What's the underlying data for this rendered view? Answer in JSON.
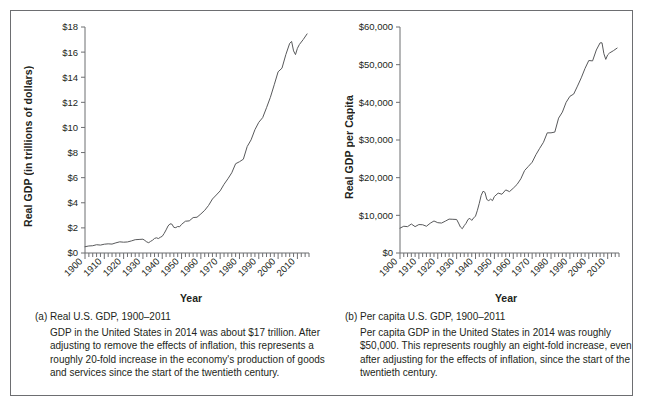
{
  "figure": {
    "border_color": "#6d6e71",
    "line_color": "#58595b",
    "background": "#ffffff"
  },
  "panels": [
    {
      "id": "panel-a",
      "caption_title": "(a) Real U.S. GDP, 1900–2011",
      "caption_body": "GDP in the United States in 2014 was about $17 trillion. After adjusting to remove the effects of inflation, this represents a roughly 20-fold increase in the economy's production of goods and services since the start of the twentieth century.",
      "chart_data": {
        "type": "line",
        "title": "",
        "xlabel": "Year",
        "ylabel": "Real GDP (in trillions of dollars)",
        "xlim": [
          1900,
          2016
        ],
        "ylim": [
          0,
          18
        ],
        "ytick_labels": [
          "$0",
          "$2",
          "$4",
          "$6",
          "$8",
          "$10",
          "$12",
          "$14",
          "$16",
          "$18"
        ],
        "ytick_values": [
          0,
          2,
          4,
          6,
          8,
          10,
          12,
          14,
          16,
          18
        ],
        "xtick_labels": [
          "1900",
          "1910",
          "1920",
          "1930",
          "1940",
          "1950",
          "1960",
          "1970",
          "1980",
          "1990",
          "2000",
          "2010"
        ],
        "xtick_values": [
          1900,
          1910,
          1920,
          1930,
          1940,
          1950,
          1960,
          1970,
          1980,
          1990,
          2000,
          2010
        ],
        "xminor_step": 2,
        "grid": false,
        "legend": "none",
        "units": "trillions of chained dollars",
        "series": [
          {
            "name": "Real U.S. GDP",
            "x": [
              1900,
              1902,
              1904,
              1906,
              1908,
              1910,
              1912,
              1914,
              1916,
              1918,
              1920,
              1922,
              1924,
              1926,
              1928,
              1930,
              1931,
              1932,
              1933,
              1934,
              1935,
              1936,
              1937,
              1938,
              1939,
              1940,
              1941,
              1942,
              1943,
              1944,
              1945,
              1946,
              1947,
              1948,
              1949,
              1950,
              1952,
              1954,
              1956,
              1958,
              1960,
              1962,
              1964,
              1966,
              1968,
              1970,
              1972,
              1974,
              1976,
              1978,
              1980,
              1982,
              1984,
              1986,
              1988,
              1990,
              1992,
              1994,
              1996,
              1998,
              2000,
              2002,
              2004,
              2006,
              2007,
              2008,
              2009,
              2010,
              2011,
              2013,
              2015
            ],
            "y": [
              0.5,
              0.56,
              0.58,
              0.66,
              0.63,
              0.7,
              0.73,
              0.71,
              0.81,
              0.89,
              0.86,
              0.88,
              0.96,
              1.06,
              1.08,
              1.1,
              1.0,
              0.88,
              0.82,
              0.93,
              1.02,
              1.16,
              1.21,
              1.15,
              1.25,
              1.33,
              1.56,
              1.84,
              2.15,
              2.32,
              2.3,
              2.04,
              2.02,
              2.11,
              2.09,
              2.28,
              2.53,
              2.56,
              2.82,
              2.85,
              3.11,
              3.4,
              3.79,
              4.3,
              4.62,
              4.95,
              5.47,
              5.91,
              6.39,
              7.11,
              7.27,
              7.47,
              8.48,
              9.01,
              9.82,
              10.41,
              10.78,
              11.57,
              12.4,
              13.4,
              14.43,
              14.72,
              15.8,
              16.7,
              16.85,
              16.1,
              15.8,
              16.3,
              16.6,
              17.0,
              17.45
            ]
          }
        ]
      }
    },
    {
      "id": "panel-b",
      "caption_title": "(b) Per capita U.S. GDP, 1900–2011",
      "caption_body": "Per capita GDP in the United States in 2014 was roughly $50,000. This represents roughly an eight-fold increase, even after adjusting for the effects of inflation, since the start of the twentieth century.",
      "chart_data": {
        "type": "line",
        "title": "",
        "xlabel": "Year",
        "ylabel": "Real GDP per Capita",
        "xlim": [
          1900,
          2016
        ],
        "ylim": [
          0,
          60000
        ],
        "ytick_labels": [
          "$0",
          "$10,000",
          "$20,000",
          "$30,000",
          "$40,000",
          "$50,000",
          "$60,000"
        ],
        "ytick_values": [
          0,
          10000,
          20000,
          30000,
          40000,
          50000,
          60000
        ],
        "xtick_labels": [
          "1900",
          "1910",
          "1920",
          "1930",
          "1940",
          "1950",
          "1960",
          "1970",
          "1980",
          "1990",
          "2000",
          "2010"
        ],
        "xtick_values": [
          1900,
          1910,
          1920,
          1930,
          1940,
          1950,
          1960,
          1970,
          1980,
          1990,
          2000,
          2010
        ],
        "xminor_step": 2,
        "grid": false,
        "legend": "none",
        "units": "chained dollars per person",
        "series": [
          {
            "name": "Real U.S. GDP per Capita",
            "x": [
              1900,
              1902,
              1904,
              1906,
              1908,
              1910,
              1912,
              1914,
              1916,
              1918,
              1920,
              1922,
              1924,
              1926,
              1928,
              1930,
              1931,
              1932,
              1933,
              1934,
              1935,
              1936,
              1937,
              1938,
              1939,
              1940,
              1941,
              1942,
              1943,
              1944,
              1945,
              1946,
              1947,
              1948,
              1949,
              1950,
              1952,
              1954,
              1956,
              1958,
              1960,
              1962,
              1964,
              1966,
              1968,
              1970,
              1972,
              1974,
              1976,
              1978,
              1980,
              1982,
              1984,
              1986,
              1988,
              1990,
              1992,
              1994,
              1996,
              1998,
              2000,
              2002,
              2004,
              2006,
              2007,
              2008,
              2009,
              2010,
              2011,
              2013,
              2015
            ],
            "y": [
              6600,
              7100,
              7000,
              7700,
              7000,
              7550,
              7500,
              7100,
              7900,
              8500,
              8050,
              7950,
              8450,
              9000,
              8950,
              8900,
              7950,
              6900,
              6450,
              7250,
              7900,
              8900,
              9200,
              8650,
              9300,
              9800,
              11350,
              13200,
              15300,
              16400,
              16100,
              14200,
              13900,
              14300,
              13900,
              15000,
              15900,
              15600,
              16750,
              16300,
              17200,
              18200,
              19700,
              21900,
              23000,
              24100,
              26100,
              27800,
              29400,
              31900,
              31900,
              32100,
              35800,
              37400,
              40000,
              41600,
              42200,
              44300,
              46500,
              49000,
              51100,
              51000,
              53900,
              55800,
              55800,
              52900,
              51400,
              52600,
              53100,
              53700,
              54400
            ]
          }
        ]
      }
    }
  ]
}
